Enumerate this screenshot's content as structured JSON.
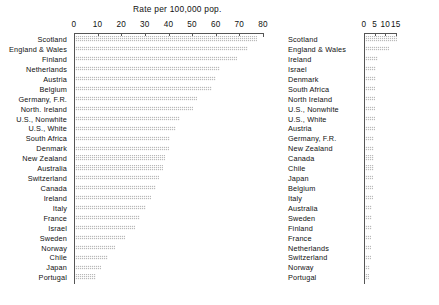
{
  "chart_data": [
    {
      "id": "left",
      "type": "bar",
      "orientation": "horizontal",
      "title": "Rate per 100,000 pop.",
      "xlabel": "",
      "ylabel": "",
      "xlim": [
        0,
        80
      ],
      "xticks": [
        0,
        10,
        20,
        30,
        40,
        50,
        60,
        70,
        80
      ],
      "grid": false,
      "legend": "none",
      "bar_color": "#b9b9b9",
      "categories": [
        "Scotland",
        "England & Wales",
        "Finland",
        "Netherlands",
        "Austria",
        "Belgium",
        "Germany, F.R.",
        "North. Ireland",
        "U.S., Nonwhite",
        "U.S., White",
        "South Africa",
        "Denmark",
        "New Zealand",
        "Australia",
        "Switzerland",
        "Canada",
        "Ireland",
        "Italy",
        "France",
        "Israel",
        "Sweden",
        "Norway",
        "Chile",
        "Japan",
        "Portugal"
      ],
      "values": [
        77.5,
        73.5,
        69.0,
        62.0,
        60.0,
        58.5,
        52.0,
        50.5,
        45.0,
        43.0,
        40.5,
        40.0,
        38.5,
        37.5,
        36.0,
        34.5,
        32.5,
        30.5,
        28.0,
        26.0,
        21.5,
        17.5,
        14.5,
        11.5,
        9.5
      ]
    },
    {
      "id": "right",
      "type": "bar",
      "orientation": "horizontal",
      "title": "Rate per 100,000 pop.",
      "xlabel": "",
      "ylabel": "",
      "xlim": [
        0,
        17
      ],
      "xticks": [
        0,
        5,
        10,
        15
      ],
      "grid": false,
      "legend": "none",
      "bar_color": "#b9b9b9",
      "categories": [
        "Scotland",
        "England & Wales",
        "Ireland",
        "Israel",
        "Denmark",
        "South Africa",
        "North Ireland",
        "U.S., Nonwhite",
        "U.S., White",
        "Austria",
        "Germany, F.R.",
        "New Zealand",
        "Canada",
        "Chile",
        "Japan",
        "Belgium",
        "Italy",
        "Australia",
        "Sweden",
        "Finland",
        "France",
        "Netherlands",
        "Switzerland",
        "Norway",
        "Portugal"
      ],
      "values": [
        15.5,
        12.0,
        6.4,
        5.9,
        5.6,
        5.4,
        5.2,
        5.1,
        5.0,
        5.0,
        4.9,
        4.8,
        4.6,
        4.5,
        4.4,
        4.3,
        4.2,
        4.0,
        3.9,
        3.7,
        3.5,
        3.3,
        3.1,
        2.8,
        2.5
      ]
    }
  ]
}
